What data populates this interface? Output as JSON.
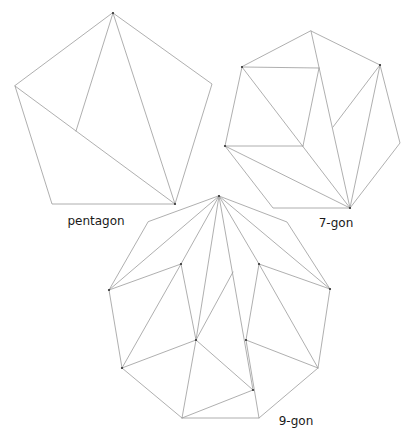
{
  "figure": {
    "edge_color": "#9a9a9a",
    "vertex_color": "#333333",
    "label_color": "#1a1a1a"
  },
  "polygons": [
    {
      "id": "pentagon",
      "label": "pentagon",
      "label_pos": [
        96,
        225
      ],
      "vertices": [
        [
          113,
          13
        ],
        [
          212,
          84
        ],
        [
          175,
          204
        ],
        [
          52,
          204
        ],
        [
          15,
          86
        ]
      ],
      "interior_edges": [
        [
          [
            113,
            13
          ],
          [
            175,
            204
          ]
        ],
        [
          [
            15,
            86
          ],
          [
            175,
            204
          ]
        ],
        [
          [
            113,
            13
          ],
          [
            76,
            131
          ]
        ]
      ],
      "marked_vertices": [
        [
          113,
          13
        ],
        [
          175,
          204
        ]
      ]
    },
    {
      "id": "heptagon",
      "label": "7-gon",
      "label_pos": [
        336,
        227
      ],
      "vertices": [
        [
          311,
          31
        ],
        [
          380,
          65
        ],
        [
          400,
          143
        ],
        [
          350,
          208
        ],
        [
          273,
          208
        ],
        [
          225,
          146
        ],
        [
          242,
          67
        ]
      ],
      "interior_edges": [
        [
          [
            242,
            67
          ],
          [
            319,
            68
          ]
        ],
        [
          [
            319,
            68
          ],
          [
            303,
            146
          ]
        ],
        [
          [
            303,
            146
          ],
          [
            225,
            146
          ]
        ],
        [
          [
            242,
            67
          ],
          [
            350,
            208
          ]
        ],
        [
          [
            225,
            146
          ],
          [
            350,
            208
          ]
        ],
        [
          [
            311,
            31
          ],
          [
            350,
            208
          ]
        ],
        [
          [
            380,
            65
          ],
          [
            350,
            208
          ]
        ],
        [
          [
            380,
            65
          ],
          [
            333,
            127
          ]
        ]
      ],
      "marked_vertices": [
        [
          242,
          67
        ],
        [
          380,
          65
        ],
        [
          225,
          146
        ],
        [
          350,
          208
        ]
      ]
    },
    {
      "id": "nonagon",
      "label": "9-gon",
      "label_pos": [
        296,
        425
      ],
      "vertices": [
        [
          219,
          196
        ],
        [
          287,
          222
        ],
        [
          330,
          289
        ],
        [
          318,
          368
        ],
        [
          259,
          418
        ],
        [
          182,
          418
        ],
        [
          122,
          368
        ],
        [
          109,
          290
        ],
        [
          148,
          222
        ]
      ],
      "interior_edges": [
        [
          [
            219,
            196
          ],
          [
            109,
            290
          ]
        ],
        [
          [
            219,
            196
          ],
          [
            181,
            264
          ]
        ],
        [
          [
            219,
            196
          ],
          [
            196,
            340
          ]
        ],
        [
          [
            219,
            196
          ],
          [
            253,
            390
          ]
        ],
        [
          [
            219,
            196
          ],
          [
            259,
            264
          ]
        ],
        [
          [
            219,
            196
          ],
          [
            330,
            289
          ]
        ],
        [
          [
            109,
            290
          ],
          [
            181,
            264
          ]
        ],
        [
          [
            181,
            264
          ],
          [
            122,
            368
          ]
        ],
        [
          [
            181,
            264
          ],
          [
            196,
            340
          ]
        ],
        [
          [
            122,
            368
          ],
          [
            196,
            340
          ]
        ],
        [
          [
            196,
            340
          ],
          [
            182,
            418
          ]
        ],
        [
          [
            196,
            340
          ],
          [
            233,
            272
          ]
        ],
        [
          [
            196,
            340
          ],
          [
            253,
            390
          ]
        ],
        [
          [
            253,
            390
          ],
          [
            182,
            418
          ]
        ],
        [
          [
            246,
            340
          ],
          [
            259,
            418
          ]
        ],
        [
          [
            259,
            264
          ],
          [
            246,
            340
          ]
        ],
        [
          [
            259,
            264
          ],
          [
            330,
            289
          ]
        ],
        [
          [
            259,
            264
          ],
          [
            318,
            368
          ]
        ],
        [
          [
            246,
            340
          ],
          [
            318,
            368
          ]
        ]
      ],
      "marked_vertices": [
        [
          219,
          196
        ],
        [
          109,
          290
        ],
        [
          181,
          264
        ],
        [
          259,
          264
        ],
        [
          330,
          289
        ],
        [
          122,
          368
        ],
        [
          196,
          340
        ],
        [
          246,
          340
        ],
        [
          253,
          390
        ]
      ]
    }
  ]
}
